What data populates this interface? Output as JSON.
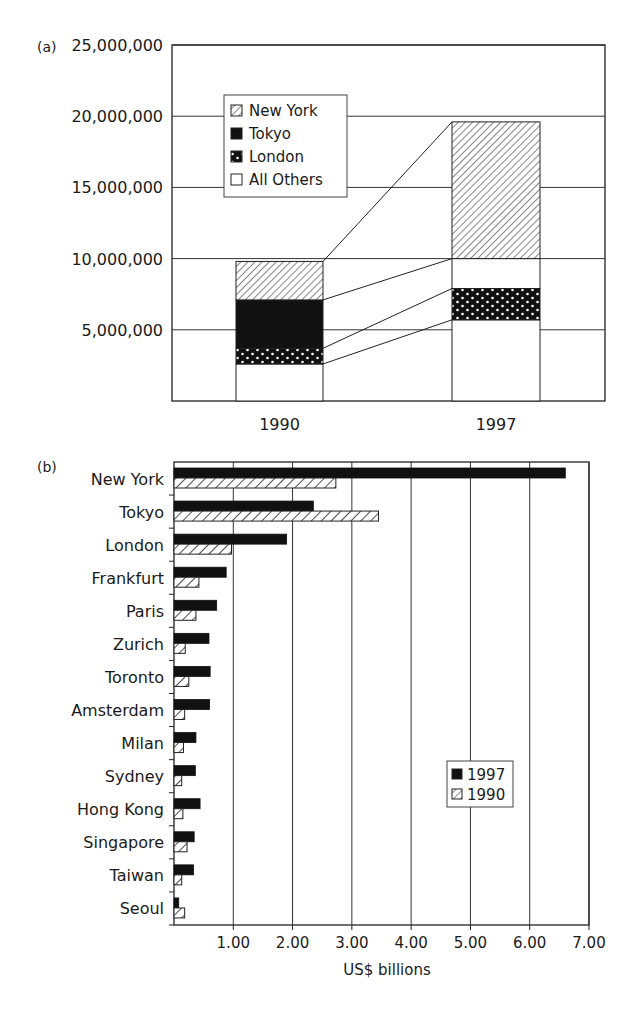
{
  "panel_labels": {
    "a": "(a)",
    "b": "(b)"
  },
  "chart_data": [
    {
      "type": "bar",
      "stacked": true,
      "title": "",
      "panel": "(a)",
      "categories": [
        "1990",
        "1997"
      ],
      "series": [
        {
          "name": "All Others",
          "pattern": "blank",
          "values": [
            2600000,
            5700000
          ]
        },
        {
          "name": "London",
          "pattern": "dots",
          "values": [
            1100000,
            2200000
          ]
        },
        {
          "name": "Tokyo",
          "pattern": "solid",
          "values": [
            3400000,
            0
          ]
        },
        {
          "name": "New York",
          "pattern": "hatch",
          "values": [
            2700000,
            9600000
          ]
        }
      ],
      "segments_note": "1997 has a blank gap between London and New York (~2.1M, part of All Others/unlabeled)",
      "totals": [
        9800000,
        19600000
      ],
      "yticks": [
        "5,000,000",
        "10,000,000",
        "15,000,000",
        "20,000,000",
        "25,000,000"
      ],
      "ylim": [
        0,
        25000000
      ],
      "xlabel": "",
      "ylabel": "",
      "grid": true,
      "legend": {
        "position": "upper-left inside",
        "entries": [
          "New York",
          "Tokyo",
          "London",
          "All Others"
        ]
      }
    },
    {
      "type": "bar",
      "orientation": "horizontal",
      "panel": "(b)",
      "categories": [
        "New York",
        "Tokyo",
        "London",
        "Frankfurt",
        "Paris",
        "Zurich",
        "Toronto",
        "Amsterdam",
        "Milan",
        "Sydney",
        "Hong Kong",
        "Singapore",
        "Taiwan",
        "Seoul"
      ],
      "series": [
        {
          "name": "1997",
          "pattern": "solid",
          "values": [
            6.6,
            2.35,
            1.9,
            0.88,
            0.72,
            0.59,
            0.61,
            0.6,
            0.37,
            0.36,
            0.44,
            0.34,
            0.33,
            0.08
          ]
        },
        {
          "name": "1990",
          "pattern": "hatch",
          "values": [
            2.73,
            3.45,
            0.97,
            0.42,
            0.37,
            0.19,
            0.25,
            0.18,
            0.16,
            0.13,
            0.15,
            0.22,
            0.13,
            0.18
          ]
        }
      ],
      "xticks": [
        "1.00",
        "2.00",
        "3.00",
        "4.00",
        "5.00",
        "6.00",
        "7.00"
      ],
      "xlim": [
        0,
        7
      ],
      "xlabel": "US$ billions",
      "ylabel": "",
      "grid": true,
      "legend": {
        "position": "lower-right inside",
        "entries": [
          "1997",
          "1990"
        ]
      }
    }
  ]
}
